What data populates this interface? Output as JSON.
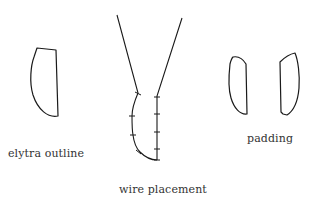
{
  "labels": {
    "elytra_outline": "elytra outline",
    "wire_placement": "wire placement",
    "padding": "padding"
  },
  "colors": {
    "stroke": "#1a1a1a",
    "text": "#333333",
    "background": "#ffffff"
  }
}
